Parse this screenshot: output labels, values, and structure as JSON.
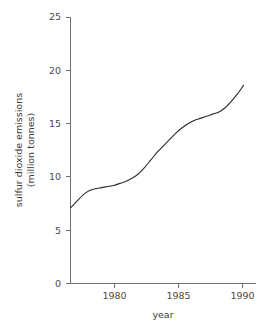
{
  "chart_data": {
    "type": "line",
    "title": "",
    "xlabel": "year",
    "ylabel": "sulfur dioxide emissions (million tonnes)",
    "ylabel_line1": "sulfur dioxide emissions",
    "ylabel_line2": "(million tonnes)",
    "xlim": [
      1976,
      1991
    ],
    "ylim": [
      0,
      25
    ],
    "grid": false,
    "legend": "none",
    "line_color": "#2b2b2b",
    "axis_color": "#6f6f6f",
    "text_color": "#3b3b3b",
    "x_ticks": [
      1980,
      1985,
      1990
    ],
    "x_tick_labels": [
      "1980",
      "1985",
      "1990"
    ],
    "y_ticks": [
      0,
      5,
      10,
      15,
      20,
      25
    ],
    "y_tick_labels": [
      "0",
      "5",
      "10",
      "15",
      "20",
      "25"
    ],
    "x": [
      1976,
      1976.5,
      1977,
      1977.5,
      1978,
      1978.5,
      1979,
      1979.5,
      1980,
      1980.5,
      1981,
      1981.5,
      1982,
      1982.5,
      1983,
      1983.5,
      1984,
      1984.5,
      1985,
      1985.5,
      1986,
      1986.5,
      1987,
      1987.5,
      1988,
      1988.5,
      1989,
      1989.5,
      1990
    ],
    "values": [
      7.1,
      7.7,
      8.3,
      8.7,
      8.9,
      9.0,
      9.1,
      9.2,
      9.4,
      9.6,
      9.9,
      10.3,
      10.9,
      11.6,
      12.3,
      12.9,
      13.5,
      14.1,
      14.6,
      15.0,
      15.3,
      15.5,
      15.7,
      15.9,
      16.1,
      16.5,
      17.1,
      17.8,
      18.6
    ],
    "series": [
      {
        "name": "sulfur dioxide emissions",
        "values": [
          7.1,
          7.7,
          8.3,
          8.7,
          8.9,
          9.0,
          9.1,
          9.2,
          9.4,
          9.6,
          9.9,
          10.3,
          10.9,
          11.6,
          12.3,
          12.9,
          13.5,
          14.1,
          14.6,
          15.0,
          15.3,
          15.5,
          15.7,
          15.9,
          16.1,
          16.5,
          17.1,
          17.8,
          18.6
        ]
      }
    ],
    "annotations": []
  }
}
